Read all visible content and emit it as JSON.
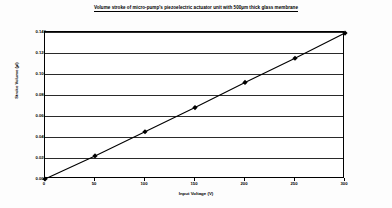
{
  "chart_data": {
    "type": "line",
    "title": "Volume stroke of micro-pump's piezoelectric actuator unit with 500µm thick glass membrane",
    "xlabel": "Input Voltage (V)",
    "ylabel": "Stroke Volume (µl)",
    "x": [
      0,
      50,
      100,
      150,
      200,
      250,
      300
    ],
    "values": [
      0.0,
      0.022,
      0.045,
      0.068,
      0.092,
      0.115,
      0.139
    ],
    "series": [
      {
        "name": "Stroke Volume",
        "values": [
          0.0,
          0.022,
          0.045,
          0.068,
          0.092,
          0.115,
          0.139
        ]
      }
    ],
    "xlim": [
      0,
      300
    ],
    "ylim": [
      0.0,
      0.14
    ],
    "xticks": [
      "0",
      "50",
      "100",
      "150",
      "200",
      "250",
      "300"
    ],
    "yticks": [
      "0.000",
      "0.020",
      "0.040",
      "0.060",
      "0.080",
      "0.100",
      "0.120",
      "0.140"
    ],
    "annotation": "y = 0.00046x",
    "grid": "horizontal",
    "legend": "none",
    "marker": "diamond",
    "line_color": "#000000",
    "marker_color": "#000000",
    "grid_color": "#2a2a2a",
    "background_color": "#ffffff"
  }
}
